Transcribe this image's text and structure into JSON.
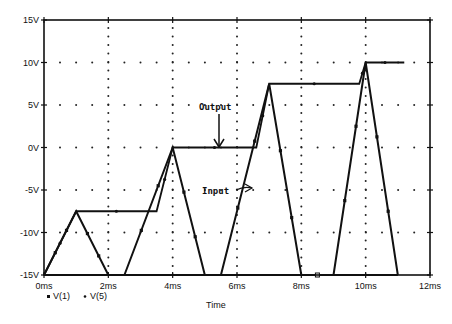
{
  "chart_data": {
    "type": "line",
    "title": "",
    "xlabel": "Time",
    "ylabel": "",
    "xlim": [
      0,
      12
    ],
    "ylim": [
      -15,
      15
    ],
    "x_unit": "ms",
    "y_unit": "V",
    "grid": "dotted",
    "x_ticks": [
      "0ms",
      "2ms",
      "4ms",
      "6ms",
      "8ms",
      "10ms",
      "12ms"
    ],
    "y_ticks": [
      "15V",
      "10V",
      "5V",
      "0V",
      "-5V",
      "-10V",
      "-15V"
    ],
    "legend_position": "bottom-left",
    "legend": [
      "V(1)",
      "V(5)"
    ],
    "series": [
      {
        "name": "V(1)",
        "label": "Input",
        "marker": "square",
        "x": [
          0,
          1,
          2,
          2.5,
          3.5,
          4,
          4.5,
          5,
          5.5,
          6,
          6.75,
          7,
          7.5,
          8,
          8.5,
          9,
          9.75,
          10,
          10.5,
          11
        ],
        "y": [
          -15,
          -7.5,
          -15,
          -15,
          -15,
          0,
          -15,
          -15,
          -15,
          -15,
          7.5,
          7.5,
          -15,
          -15,
          -15,
          -15,
          10,
          10,
          -15,
          -15
        ],
        "segments": [
          {
            "x": [
              0,
              1,
              2
            ],
            "y": [
              -15,
              -7.5,
              -15
            ]
          },
          {
            "x": [
              2.5,
              4,
              5
            ],
            "y": [
              -15,
              0,
              -15
            ]
          },
          {
            "x": [
              5.5,
              7,
              8
            ],
            "y": [
              -15,
              7.5,
              -15
            ]
          },
          {
            "x": [
              9,
              10,
              11
            ],
            "y": [
              -15,
              10,
              -15
            ]
          }
        ]
      },
      {
        "name": "V(5)",
        "label": "Output",
        "marker": "dot",
        "x": [
          0,
          1,
          3.5,
          4,
          6.6,
          7,
          9.8,
          10,
          11.2
        ],
        "y": [
          -15,
          -7.5,
          -7.5,
          0,
          0,
          7.5,
          7.5,
          10,
          10
        ]
      }
    ],
    "annotations": [
      {
        "text": "Output",
        "x": 5.3,
        "y": 3.5,
        "arrow_to": [
          5.3,
          0
        ]
      },
      {
        "text": "Input",
        "x": 5.5,
        "y": -5,
        "arrow_to": [
          6.6,
          -5
        ]
      }
    ]
  },
  "axes": {
    "x_label": "Time",
    "x_ticks": [
      "0ms",
      "2ms",
      "4ms",
      "6ms",
      "8ms",
      "10ms",
      "12ms"
    ],
    "y_ticks": [
      "15V",
      "10V",
      "5V",
      "0V",
      "-5V",
      "-10V",
      "-15V"
    ]
  },
  "annotations": {
    "output": "Output",
    "input": "Input"
  },
  "legend": {
    "items": [
      {
        "label": "V(1)",
        "marker": "square"
      },
      {
        "label": "V(5)",
        "marker": "dot"
      }
    ]
  }
}
